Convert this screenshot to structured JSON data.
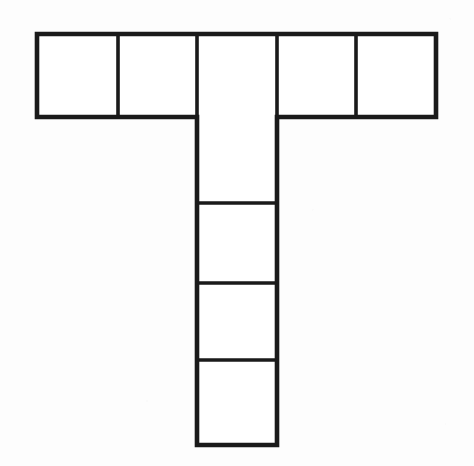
{
  "figure": {
    "name": "t-shaped-polyomino",
    "background_color": "#fdfdfd",
    "stroke_color": "#1a1a1a",
    "stroke_width_outer": 4.6,
    "stroke_width_inner": 3.6,
    "canvas": {
      "width": 474,
      "height": 466
    },
    "labels": [],
    "annotations": [],
    "text_content": ""
  },
  "chart_data": {
    "type": "diagram",
    "title": "",
    "xlabel": "",
    "ylabel": "",
    "shape": "T-shaped polyomino (nonomino net)",
    "square_count": 9,
    "unit_square_size_px": 80,
    "grid": {
      "x_boundaries": [
        37,
        118,
        197,
        277,
        356,
        436
      ],
      "y_boundaries_top_row": [
        34,
        117
      ],
      "y_boundaries_stem": [
        117,
        203,
        283,
        360,
        445
      ]
    },
    "groups": [
      {
        "name": "top-bar",
        "orientation": "horizontal",
        "square_count": 5,
        "x": 37,
        "y": 34,
        "width": 399,
        "height": 83,
        "dividers_x": [
          118,
          197,
          277,
          356
        ]
      },
      {
        "name": "vertical-stem",
        "orientation": "vertical",
        "square_count": 4,
        "x": 197,
        "y": 117,
        "width": 80,
        "height": 328,
        "dividers_y": [
          203,
          283,
          360
        ]
      }
    ],
    "cells": [
      {
        "id": "top-1",
        "row": 0,
        "col": 0,
        "x": 37,
        "y": 34,
        "w": 81,
        "h": 83
      },
      {
        "id": "top-2",
        "row": 0,
        "col": 1,
        "x": 118,
        "y": 34,
        "w": 79,
        "h": 83
      },
      {
        "id": "top-3",
        "row": 0,
        "col": 2,
        "x": 197,
        "y": 34,
        "w": 80,
        "h": 83
      },
      {
        "id": "top-4",
        "row": 0,
        "col": 3,
        "x": 277,
        "y": 34,
        "w": 79,
        "h": 83
      },
      {
        "id": "top-5",
        "row": 0,
        "col": 4,
        "x": 356,
        "y": 34,
        "w": 80,
        "h": 83
      },
      {
        "id": "stem-1",
        "row": 1,
        "col": 2,
        "x": 197,
        "y": 117,
        "w": 80,
        "h": 86
      },
      {
        "id": "stem-2",
        "row": 2,
        "col": 2,
        "x": 197,
        "y": 203,
        "w": 80,
        "h": 80
      },
      {
        "id": "stem-3",
        "row": 3,
        "col": 2,
        "x": 197,
        "y": 283,
        "w": 80,
        "h": 77
      },
      {
        "id": "stem-4",
        "row": 4,
        "col": 2,
        "x": 197,
        "y": 360,
        "w": 80,
        "h": 85
      }
    ],
    "outline_path": "M37,34 L436,34 L436,117 L277,117 L277,445 L197,445 L197,117 L37,117 Z",
    "inner_lines": [
      {
        "orientation": "vertical",
        "x1": 118,
        "y1": 34,
        "x2": 118,
        "y2": 117
      },
      {
        "orientation": "vertical",
        "x1": 197,
        "y1": 34,
        "x2": 197,
        "y2": 117
      },
      {
        "orientation": "vertical",
        "x1": 277,
        "y1": 34,
        "x2": 277,
        "y2": 117
      },
      {
        "orientation": "vertical",
        "x1": 356,
        "y1": 34,
        "x2": 356,
        "y2": 117
      },
      {
        "orientation": "horizontal",
        "x1": 197,
        "y1": 203,
        "x2": 277,
        "y2": 203
      },
      {
        "orientation": "horizontal",
        "x1": 197,
        "y1": 283,
        "x2": 277,
        "y2": 283
      },
      {
        "orientation": "horizontal",
        "x1": 197,
        "y1": 360,
        "x2": 277,
        "y2": 360
      }
    ]
  }
}
